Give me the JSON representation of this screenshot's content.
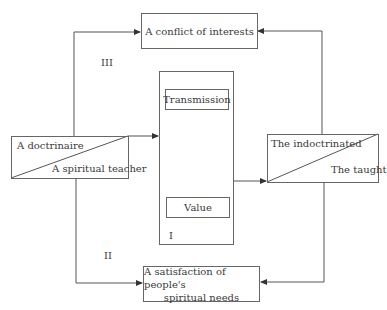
{
  "diagram": {
    "top_box": {
      "label": "A conflict of interests"
    },
    "bottom_box": {
      "label_line1": "A satisfaction of people's",
      "label_line2": "spiritual needs"
    },
    "center_box": {
      "transmission": "Transmission",
      "value": "Value",
      "roman": "I"
    },
    "left_box": {
      "upper": "A doctrinaire",
      "lower": "A spiritual teacher"
    },
    "right_box": {
      "upper": "The indoctrinated",
      "lower": "The taught"
    },
    "path_labels": {
      "upper": "III",
      "lower": "II"
    },
    "colors": {
      "line": "#555555",
      "text": "#3a3a3a",
      "background": "#ffffff"
    }
  }
}
